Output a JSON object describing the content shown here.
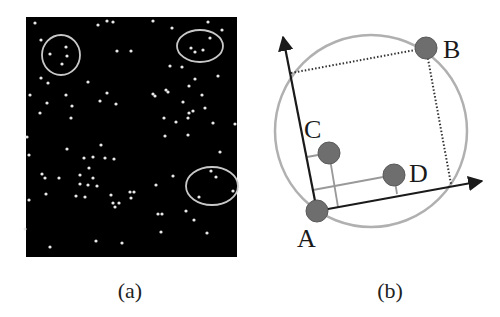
{
  "figure": {
    "panel_a": {
      "caption": "(a)",
      "background_color": "#000000",
      "rect": {
        "x": 26,
        "y": 17,
        "width": 211,
        "height": 240
      },
      "dot_color": "#e8e8e8",
      "highlight_color": "#c8c8c8",
      "dots": [
        [
          35,
          23
        ],
        [
          98,
          25
        ],
        [
          107,
          21
        ],
        [
          113,
          22
        ],
        [
          41,
          40
        ],
        [
          66,
          47
        ],
        [
          50,
          54
        ],
        [
          67,
          56
        ],
        [
          62,
          64
        ],
        [
          117,
          51
        ],
        [
          131,
          51
        ],
        [
          41,
          78
        ],
        [
          48,
          83
        ],
        [
          88,
          82
        ],
        [
          30,
          95
        ],
        [
          66,
          95
        ],
        [
          107,
          93
        ],
        [
          100,
          101
        ],
        [
          47,
          103
        ],
        [
          116,
          104
        ],
        [
          72,
          106
        ],
        [
          40,
          113
        ],
        [
          71,
          118
        ],
        [
          153,
          21
        ],
        [
          172,
          28
        ],
        [
          208,
          22
        ],
        [
          222,
          30
        ],
        [
          210,
          38
        ],
        [
          191,
          48
        ],
        [
          195,
          52
        ],
        [
          203,
          50
        ],
        [
          170,
          66
        ],
        [
          182,
          67
        ],
        [
          195,
          79
        ],
        [
          218,
          76
        ],
        [
          189,
          86
        ],
        [
          153,
          94
        ],
        [
          155,
          96
        ],
        [
          166,
          90
        ],
        [
          168,
          92
        ],
        [
          202,
          95
        ],
        [
          183,
          102
        ],
        [
          205,
          108
        ],
        [
          193,
          111
        ],
        [
          189,
          113
        ],
        [
          188,
          118
        ],
        [
          164,
          118
        ],
        [
          176,
          122
        ],
        [
          213,
          123
        ],
        [
          235,
          124
        ],
        [
          27,
          137
        ],
        [
          29,
          155
        ],
        [
          67,
          149
        ],
        [
          101,
          145
        ],
        [
          84,
          158
        ],
        [
          93,
          157
        ],
        [
          105,
          158
        ],
        [
          114,
          159
        ],
        [
          89,
          168
        ],
        [
          42,
          174
        ],
        [
          45,
          178
        ],
        [
          59,
          178
        ],
        [
          80,
          175
        ],
        [
          93,
          178
        ],
        [
          80,
          184
        ],
        [
          97,
          186
        ],
        [
          88,
          185
        ],
        [
          85,
          197
        ],
        [
          76,
          196
        ],
        [
          46,
          194
        ],
        [
          111,
          195
        ],
        [
          130,
          192
        ],
        [
          131,
          198
        ],
        [
          119,
          203
        ],
        [
          113,
          203
        ],
        [
          29,
          200
        ],
        [
          115,
          207
        ],
        [
          25,
          229
        ],
        [
          96,
          241
        ],
        [
          122,
          243
        ],
        [
          50,
          247
        ],
        [
          165,
          136
        ],
        [
          188,
          135
        ],
        [
          220,
          152
        ],
        [
          173,
          176
        ],
        [
          156,
          185
        ],
        [
          134,
          192
        ],
        [
          211,
          171
        ],
        [
          216,
          177
        ],
        [
          233,
          191
        ],
        [
          199,
          197
        ],
        [
          186,
          211
        ],
        [
          158,
          214
        ],
        [
          162,
          214
        ],
        [
          194,
          220
        ],
        [
          161,
          232
        ],
        [
          207,
          233
        ]
      ],
      "highlights": [
        {
          "cx": 61,
          "cy": 55,
          "rx": 19,
          "ry": 20
        },
        {
          "cx": 200,
          "cy": 46,
          "rx": 23,
          "ry": 16
        },
        {
          "cx": 212,
          "cy": 186,
          "rx": 26,
          "ry": 19
        }
      ]
    },
    "panel_b": {
      "caption": "(b)",
      "bounding_circle": {
        "cx": 371,
        "cy": 131,
        "r": 96,
        "color": "#b0b0b0"
      },
      "axis_color": "#1a1a1a",
      "projection_color": "#999999",
      "point_fill": "#6e6e6e",
      "origin": [
        317,
        211
      ],
      "y_axis_tip": [
        283,
        37
      ],
      "x_axis_tip": [
        482,
        181
      ],
      "points": [
        {
          "name": "A",
          "cx": 317,
          "cy": 211,
          "label_x": 297,
          "label_y": 247
        },
        {
          "name": "B",
          "cx": 426,
          "cy": 48,
          "label_x": 443,
          "label_y": 58
        },
        {
          "name": "C",
          "cx": 329,
          "cy": 153,
          "label_x": 304,
          "label_y": 138
        },
        {
          "name": "D",
          "cx": 394,
          "cy": 175,
          "label_x": 409,
          "label_y": 182
        }
      ],
      "dotted_box": [
        [
          291,
          73
        ],
        [
          426,
          48
        ],
        [
          451,
          184
        ]
      ],
      "projections": [
        [
          [
            307,
            157
          ],
          [
            329,
            153
          ]
        ],
        [
          [
            329,
            153
          ],
          [
            338,
            207
          ]
        ],
        [
          [
            313,
            190
          ],
          [
            394,
            175
          ]
        ],
        [
          [
            394,
            175
          ],
          [
            397,
            194
          ]
        ]
      ]
    }
  }
}
